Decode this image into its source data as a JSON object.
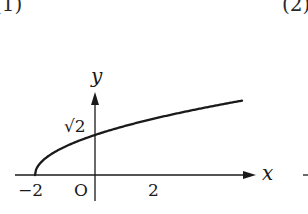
{
  "parts": {
    "left_label": "(1)",
    "right_label": "(2)"
  },
  "axes": {
    "x_label": "x",
    "y_label": "y",
    "origin_label": "O"
  },
  "ticks": {
    "x_neg": "−2",
    "x_pos": "2",
    "y_intercept": "√2"
  },
  "colors": {
    "ink": "#1a1a1a",
    "background": "#ffffff"
  },
  "chart_data": {
    "type": "line",
    "title": "",
    "function": "y = sqrt(x + 2)",
    "xlabel": "x",
    "ylabel": "y",
    "xlim": [
      -2.7,
      5.5
    ],
    "ylim": [
      -0.9,
      3.0
    ],
    "grid": false,
    "legend": null,
    "annotations": [
      {
        "text": "−2",
        "at": [
          -2,
          0
        ],
        "role": "x-intercept tick"
      },
      {
        "text": "O",
        "at": [
          0,
          0
        ],
        "role": "origin"
      },
      {
        "text": "2",
        "at": [
          2,
          0
        ],
        "role": "x tick"
      },
      {
        "text": "√2",
        "at": [
          0,
          1.414
        ],
        "role": "y-intercept"
      }
    ],
    "series": [
      {
        "name": "y = √(x+2)",
        "x": [
          -2,
          -1.5,
          -1,
          0,
          1,
          2,
          3,
          4,
          4.9
        ],
        "values": [
          0,
          0.707,
          1,
          1.414,
          1.732,
          2,
          2.236,
          2.449,
          2.627
        ]
      }
    ]
  }
}
